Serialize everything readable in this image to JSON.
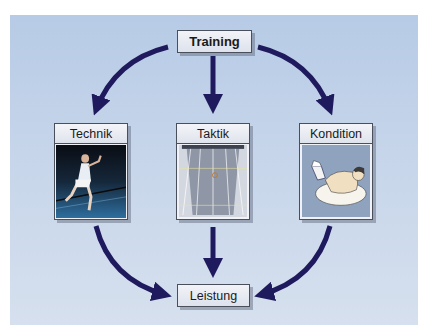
{
  "diagram": {
    "title_node": "Training",
    "result_node": "Leistung",
    "cards": [
      {
        "label": "Technik",
        "image": "badminton-player-photo"
      },
      {
        "label": "Taktik",
        "image": "badminton-court-topview"
      },
      {
        "label": "Kondition",
        "image": "fitness-exercise-illustration"
      }
    ],
    "edges": [
      {
        "from": "Training",
        "to": "Technik"
      },
      {
        "from": "Training",
        "to": "Taktik"
      },
      {
        "from": "Training",
        "to": "Kondition"
      },
      {
        "from": "Technik",
        "to": "Leistung"
      },
      {
        "from": "Taktik",
        "to": "Leistung"
      },
      {
        "from": "Kondition",
        "to": "Leistung"
      }
    ],
    "colors": {
      "arrow": "#1f1a5e",
      "panel_background": "#c6d5ea",
      "box_border": "#4a4f5c"
    }
  }
}
